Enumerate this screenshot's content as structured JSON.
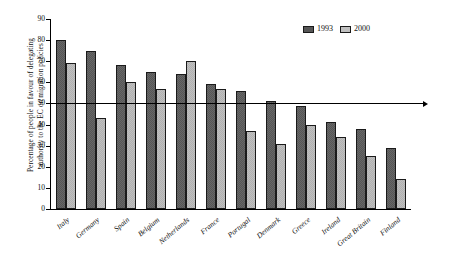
{
  "chart_data": {
    "type": "bar",
    "title": "",
    "xlabel": "",
    "ylabel": "Percentage of people in favour of delegating authority to the EC on migration policies",
    "ylim": [
      0,
      90
    ],
    "ytick_step": 10,
    "yticks": [
      90,
      80,
      70,
      60,
      50,
      40,
      30,
      20,
      10,
      0
    ],
    "grid": false,
    "legend_position": "top-right",
    "categories": [
      "Italy",
      "Germany",
      "Spain",
      "Belgium",
      "Netherlands",
      "France",
      "Portugal",
      "Denmark",
      "Greece",
      "Ireland",
      "Great Britain",
      "Finland"
    ],
    "series": [
      {
        "name": "1993",
        "color": "#565656",
        "values": [
          80,
          75,
          68,
          65,
          64,
          59,
          56,
          51,
          49,
          41,
          38,
          29
        ]
      },
      {
        "name": "2000",
        "color": "#c0c0c0",
        "values": [
          69,
          43,
          60,
          57,
          70,
          57,
          37,
          31,
          40,
          34,
          25,
          14
        ]
      }
    ],
    "annotations": [
      {
        "type": "hline",
        "value": 50,
        "label": "50% reference line",
        "arrow": true
      }
    ]
  },
  "yaxis": {
    "title_line1": "Percentage of people in favour of delegating",
    "title_line2": "authority to the EC on migration policies"
  },
  "legend": {
    "items": [
      {
        "label": "1993",
        "swatch": "dark-gray-hatch"
      },
      {
        "label": "2000",
        "swatch": "light-gray-hatch"
      }
    ]
  }
}
